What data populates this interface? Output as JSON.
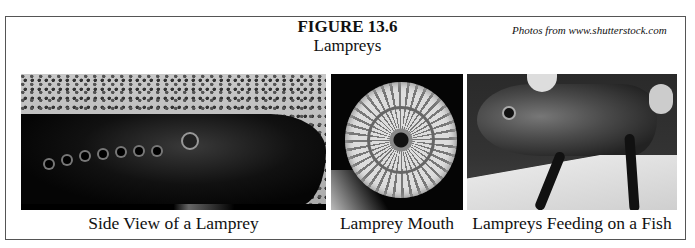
{
  "figure": {
    "number": "FIGURE 13.6",
    "title": "Lampreys",
    "credit": "Photos from www.shutterstock.com"
  },
  "photos": [
    {
      "id": "side-view",
      "caption": "Side View of a Lamprey",
      "description": "Black-and-white photo of a lamprey lying on gravel, showing eye and gill openings"
    },
    {
      "id": "mouth",
      "caption": "Lamprey Mouth",
      "description": "Close-up of circular sucker mouth with rows of teeth"
    },
    {
      "id": "feeding",
      "caption": "Lampreys Feeding on a Fish",
      "description": "Hands holding a fish with lampreys attached to its body"
    }
  ]
}
